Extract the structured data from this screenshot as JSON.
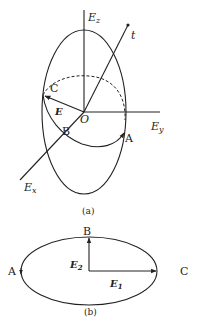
{
  "figure_a": {
    "caption": "(a)",
    "axes": {
      "z_label": "E",
      "z_sub": "z",
      "y_label": "E",
      "y_sub": "y",
      "x_label": "E",
      "x_sub": "x",
      "t_label": "t"
    },
    "origin_label": "O",
    "vector_label": "E",
    "points": {
      "A": "A",
      "B": "B",
      "C": "C"
    }
  },
  "figure_b": {
    "caption": "(b)",
    "vectors": {
      "e1_label": "E",
      "e1_sub": "1",
      "e2_label": "E",
      "e2_sub": "2"
    },
    "points": {
      "A": "A",
      "B": "B",
      "C": "C"
    }
  },
  "colors": {
    "stroke": "#222222",
    "background": "#ffffff"
  }
}
